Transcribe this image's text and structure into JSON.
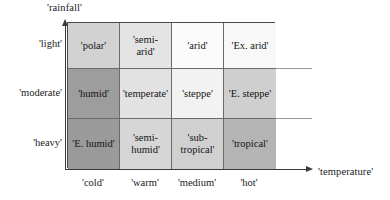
{
  "axes": {
    "y_title": "'rainfall'",
    "x_title": "'temperature'"
  },
  "row_labels": [
    {
      "label": "'light'"
    },
    {
      "label": "'moderate'"
    },
    {
      "label": "'heavy'"
    }
  ],
  "col_labels": [
    {
      "label": "'cold'"
    },
    {
      "label": "'warm'"
    },
    {
      "label": "'medium'"
    },
    {
      "label": "'hot'"
    }
  ],
  "matrix": {
    "rows": [
      {
        "rainfall": "'light'",
        "cells": [
          {
            "label": "'polar'",
            "fill": "#d2d2d2"
          },
          {
            "label": "'semi-\narid'",
            "line1": "'semi-",
            "line2": "arid'",
            "fill": "#e4e4e4"
          },
          {
            "label": "'arid'",
            "fill": "#fbfbfb"
          },
          {
            "label": "'Ex. arid'",
            "fill": "#f8f8f8"
          }
        ]
      },
      {
        "rainfall": "'moderate'",
        "cells": [
          {
            "label": "'humid'",
            "fill": "#9d9d9d"
          },
          {
            "label": "'temperate'",
            "fill": "#e2e2e2"
          },
          {
            "label": "'steppe'",
            "fill": "#f2f2f2"
          },
          {
            "label": "'E. steppe'",
            "fill": "#cfcfcf"
          }
        ]
      },
      {
        "rainfall": "'heavy'",
        "cells": [
          {
            "label": "'E. humid'",
            "fill": "#9a9a9a"
          },
          {
            "label": "'semi-\nhumid'",
            "line1": "'semi-",
            "line2": "humid'",
            "fill": "#d6d6d6"
          },
          {
            "label": "'sub-\ntropical'",
            "line1": "'sub-",
            "line2": "tropical'",
            "fill": "#d0d0d0"
          },
          {
            "label": "'tropical'",
            "fill": "#b4b4b4"
          }
        ]
      }
    ]
  },
  "colors": {
    "axis": "#3a3a3a",
    "matrix_border": "#4a4a4a",
    "cell_border": "#6b6b6b",
    "gridline_stub": "#9a9a9a",
    "text": "#141414",
    "background": "#ffffff"
  }
}
